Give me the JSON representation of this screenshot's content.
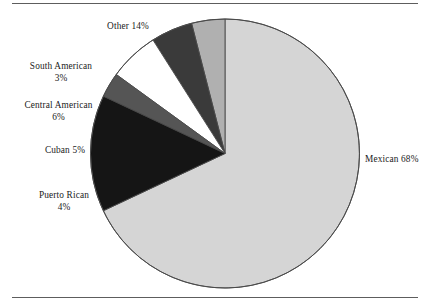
{
  "chart_data": {
    "type": "pie",
    "title": "",
    "subtitle": "",
    "xlabel": "",
    "ylabel": "",
    "legend_position": "callout-labels",
    "grid": false,
    "start_angle_deg": 90,
    "direction": "clockwise-first-slice",
    "categories": [
      "Mexican",
      "Puerto Rican",
      "Cuban",
      "Central American",
      "South American",
      "Other"
    ],
    "values": [
      68,
      4,
      5,
      6,
      3,
      14
    ],
    "unit": "%",
    "slices": [
      {
        "label": "Mexican",
        "value": 68,
        "value_text": "68%",
        "label_text": "Mexican 68%",
        "color": "#d5d5d5",
        "label_lines": [
          "Mexican 68%"
        ]
      },
      {
        "label": "Puerto Rican",
        "value": 4,
        "value_text": "4%",
        "label_text": "Puerto Rican 4%",
        "color": "#b0b0b0",
        "label_lines": [
          "Puerto Rican",
          "4%"
        ]
      },
      {
        "label": "Cuban",
        "value": 5,
        "value_text": "5%",
        "label_text": "Cuban 5%",
        "color": "#3a3a3a",
        "label_lines": [
          "Cuban 5%"
        ]
      },
      {
        "label": "Central American",
        "value": 6,
        "value_text": "6%",
        "label_text": "Central American 6%",
        "color": "#ffffff",
        "label_lines": [
          "Central American",
          "6%"
        ]
      },
      {
        "label": "South American",
        "value": 3,
        "value_text": "3%",
        "label_text": "South American 3%",
        "color": "#555555",
        "label_lines": [
          "South American",
          "3%"
        ]
      },
      {
        "label": "Other",
        "value": 14,
        "value_text": "14%",
        "label_text": "Other 14%",
        "color": "#151515",
        "label_lines": [
          "Other 14%"
        ]
      }
    ]
  },
  "labels": {
    "other": {
      "line1": "Other 14%"
    },
    "south_american": {
      "line1": "South  American",
      "line2": "3%"
    },
    "central_american": {
      "line1": "Central American",
      "line2": "6%"
    },
    "cuban": {
      "line1": "Cuban 5%"
    },
    "puerto_rican": {
      "line1": "Puerto Rican",
      "line2": "4%"
    },
    "mexican": {
      "line1": "Mexican 68%"
    }
  },
  "style": {
    "slice_outline": "#4a4a4a",
    "rule_color": "#5d5d5d",
    "background": "#ffffff"
  }
}
